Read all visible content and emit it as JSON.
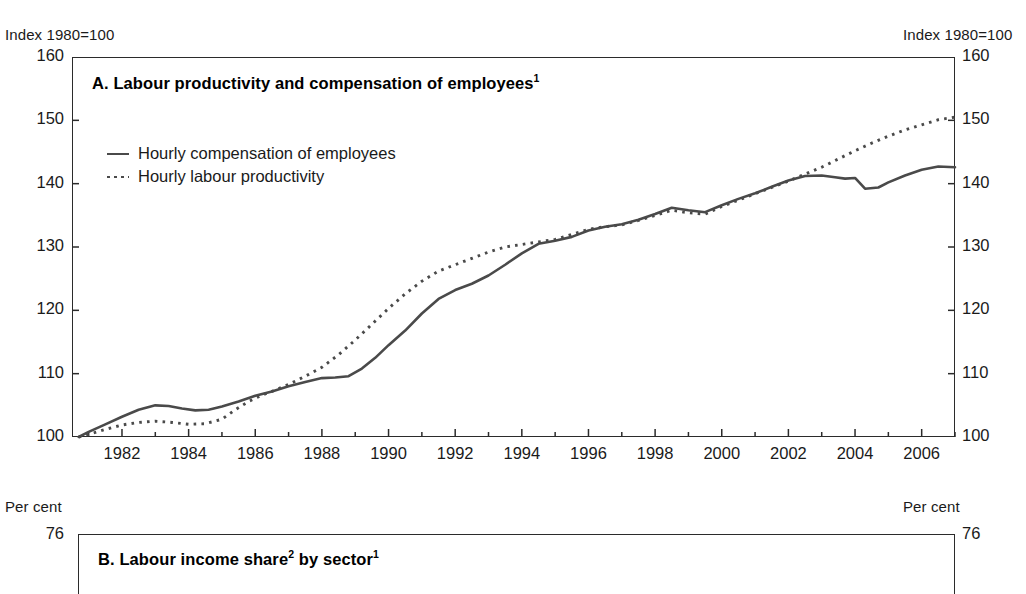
{
  "figure": {
    "panels": [
      {
        "id": "A",
        "title": "A. Labour productivity and compensation of employees",
        "title_footnote": "1",
        "unit_label_left": "Index 1980=100",
        "unit_label_right": "Index 1980=100"
      },
      {
        "id": "B",
        "title": "B. Labour income share",
        "title_footnote_a": "2",
        "title_mid": " by sector",
        "title_footnote_b": "1",
        "unit_label_left": "Per cent",
        "unit_label_right": "Per cent",
        "first_ytick": "76"
      }
    ]
  },
  "chart_data": {
    "type": "line",
    "title": "A. Labour productivity and compensation of employees",
    "xlabel": "",
    "ylabel": "Index 1980=100",
    "ylim": [
      100,
      160
    ],
    "xlim": [
      1980.5,
      2007.0
    ],
    "grid": false,
    "legend_position": "upper-left-inside",
    "yticks": [
      100,
      110,
      120,
      130,
      140,
      150,
      160
    ],
    "ytick_labels": [
      "100",
      "110",
      "120",
      "130",
      "140",
      "150",
      "160"
    ],
    "xticks": [
      1982,
      1984,
      1986,
      1988,
      1990,
      1992,
      1994,
      1996,
      1998,
      2000,
      2002,
      2004,
      2006
    ],
    "xtick_labels": [
      "1982",
      "1984",
      "1986",
      "1988",
      "1990",
      "1992",
      "1994",
      "1996",
      "1998",
      "2000",
      "2002",
      "2004",
      "2006"
    ],
    "xtick_minor_step": 1,
    "series": [
      {
        "name": "Hourly compensation of employees",
        "style": "solid",
        "color": "#4a4a4a",
        "x": [
          1980.7,
          1981.0,
          1981.5,
          1982.0,
          1982.5,
          1983.0,
          1983.4,
          1983.8,
          1984.2,
          1984.6,
          1985.0,
          1985.5,
          1986.0,
          1986.5,
          1987.0,
          1987.5,
          1988.0,
          1988.4,
          1988.8,
          1989.2,
          1989.6,
          1990.0,
          1990.5,
          1991.0,
          1991.5,
          1992.0,
          1992.5,
          1993.0,
          1993.5,
          1994.0,
          1994.5,
          1995.0,
          1995.5,
          1996.0,
          1996.5,
          1997.0,
          1997.5,
          1998.0,
          1998.5,
          1999.0,
          1999.5,
          2000.0,
          2000.5,
          2001.0,
          2001.5,
          2002.0,
          2002.5,
          2003.0,
          2003.4,
          2003.7,
          2004.0,
          2004.3,
          2004.7,
          2005.0,
          2005.5,
          2006.0,
          2006.5,
          2007.0
        ],
        "y": [
          100.0,
          100.8,
          102.0,
          103.2,
          104.3,
          105.0,
          104.9,
          104.5,
          104.2,
          104.3,
          104.8,
          105.6,
          106.5,
          107.2,
          108.0,
          108.7,
          109.3,
          109.4,
          109.6,
          110.8,
          112.5,
          114.5,
          116.8,
          119.5,
          121.8,
          123.2,
          124.2,
          125.5,
          127.2,
          129.0,
          130.5,
          131.0,
          131.6,
          132.6,
          133.2,
          133.6,
          134.3,
          135.2,
          136.2,
          135.8,
          135.5,
          136.6,
          137.6,
          138.5,
          139.5,
          140.5,
          141.2,
          141.3,
          141.0,
          140.8,
          140.9,
          139.2,
          139.4,
          140.2,
          141.3,
          142.2,
          142.7,
          142.6
        ]
      },
      {
        "name": "Hourly labour productivity",
        "style": "dotted",
        "color": "#4a4a4a",
        "x": [
          1980.7,
          1981.0,
          1981.5,
          1982.0,
          1982.5,
          1983.0,
          1983.5,
          1984.0,
          1984.5,
          1985.0,
          1985.4,
          1985.8,
          1986.2,
          1986.6,
          1987.0,
          1987.5,
          1988.0,
          1988.5,
          1989.0,
          1989.5,
          1990.0,
          1990.5,
          1991.0,
          1991.5,
          1992.0,
          1992.5,
          1993.0,
          1993.5,
          1994.0,
          1994.5,
          1995.0,
          1995.5,
          1996.0,
          1996.5,
          1997.0,
          1997.5,
          1998.0,
          1998.5,
          1999.0,
          1999.5,
          2000.0,
          2000.5,
          2001.0,
          2001.5,
          2002.0,
          2002.5,
          2003.0,
          2003.5,
          2004.0,
          2004.5,
          2005.0,
          2005.5,
          2006.0,
          2006.5,
          2007.0
        ],
        "y": [
          100.0,
          100.4,
          101.2,
          101.9,
          102.3,
          102.5,
          102.3,
          102.0,
          102.1,
          102.8,
          104.3,
          105.6,
          106.6,
          107.4,
          108.3,
          109.6,
          111.0,
          113.0,
          115.3,
          117.8,
          120.3,
          122.6,
          124.6,
          126.2,
          127.2,
          128.2,
          129.2,
          130.0,
          130.4,
          130.8,
          131.2,
          132.0,
          132.8,
          133.2,
          133.5,
          134.2,
          135.0,
          135.8,
          135.4,
          135.2,
          136.4,
          137.4,
          138.4,
          139.4,
          140.4,
          141.5,
          142.6,
          143.9,
          145.2,
          146.4,
          147.5,
          148.5,
          149.3,
          150.1,
          150.5
        ]
      }
    ]
  }
}
